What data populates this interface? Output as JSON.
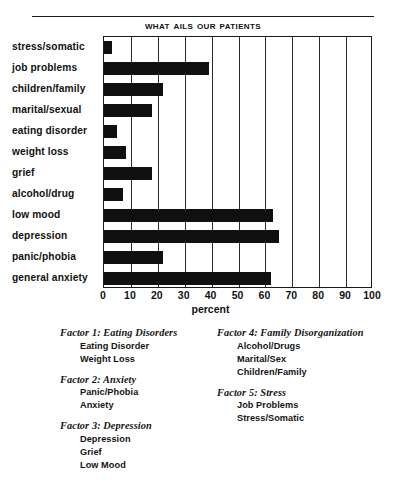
{
  "chart_data": {
    "type": "bar",
    "orientation": "horizontal",
    "title": "What Ails Our Patients",
    "xlabel": "percent",
    "ylabel": "",
    "xlim": [
      0,
      100
    ],
    "xticks": [
      0,
      10,
      20,
      30,
      40,
      50,
      60,
      70,
      80,
      90,
      100
    ],
    "grid": true,
    "grid_axis": "x",
    "legend": "none",
    "bar_color": "#101010",
    "categories": [
      "stress/somatic",
      "job problems",
      "children/family",
      "marital/sexual",
      "eating disorder",
      "weight loss",
      "grief",
      "alcohol/drug",
      "low mood",
      "depression",
      "panic/phobia",
      "general anxiety"
    ],
    "values": [
      3,
      39,
      22,
      18,
      5,
      8,
      18,
      7,
      63,
      65,
      22,
      62
    ]
  },
  "factors": {
    "left_column": [
      {
        "title": "Factor 1: Eating Disorders",
        "items": [
          "Eating Disorder",
          "Weight Loss"
        ]
      },
      {
        "title": "Factor 2: Anxiety",
        "items": [
          "Panic/Phobia",
          "Anxiety"
        ]
      },
      {
        "title": "Factor 3: Depression",
        "items": [
          "Depression",
          "Grief",
          "Low Mood"
        ]
      }
    ],
    "right_column": [
      {
        "title": "Factor 4: Family Disorganization",
        "items": [
          "Alcohol/Drugs",
          "Marital/Sex",
          "Children/Family"
        ]
      },
      {
        "title": "Factor 5: Stress",
        "items": [
          "Job Problems",
          "Stress/Somatic"
        ]
      }
    ]
  }
}
